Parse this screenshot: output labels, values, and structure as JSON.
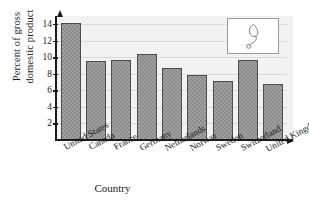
{
  "chart_data": {
    "type": "bar",
    "title": "",
    "subtitle": "",
    "xlabel": "Country",
    "ylabel": "Percent of gross domestic product",
    "ylabel_line1": "Percent of gross",
    "ylabel_line2": "domestic product",
    "categories": [
      "United States",
      "Canada",
      "France",
      "Germany",
      "Netherlands",
      "Norway",
      "Sweden",
      "Switzerland",
      "United Kingdom"
    ],
    "values": [
      14.1,
      9.5,
      9.7,
      10.4,
      8.7,
      7.9,
      7.1,
      9.7,
      6.8
    ],
    "ylim": [
      0,
      15
    ],
    "yticks": [
      2,
      4,
      6,
      8,
      10,
      12,
      14
    ],
    "ytick_labels": [
      "2",
      "4",
      "6",
      "8",
      "10",
      "12",
      "14"
    ],
    "grid": true,
    "grid_axis": "y",
    "legend": "none",
    "bar_color": "#8d8d8d",
    "bar_edge_color": "#4d4d4d",
    "plot_background": "#f2f2f2",
    "axis_color": "#1a1a1a",
    "gridline_color": "#d8d8d8"
  },
  "inset": {
    "icon_name": "stethoscope-icon",
    "border_color": "#9a9a9a",
    "background": "#ffffff"
  }
}
